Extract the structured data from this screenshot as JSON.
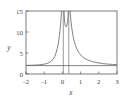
{
  "chart_data": {
    "type": "line",
    "title": "",
    "subtitle": "",
    "xlabel": "x",
    "ylabel": "y",
    "xlim": [
      -2,
      3
    ],
    "ylim": [
      0,
      15
    ],
    "grid": false,
    "legend": "none",
    "x_ticks": [
      "-2",
      "-1",
      "0",
      "1",
      "2",
      "3"
    ],
    "x_tick_values": [
      -2,
      -1,
      0,
      1,
      2,
      3
    ],
    "y_ticks": [
      "0",
      "5",
      "10",
      "15"
    ],
    "y_tick_values": [
      0,
      5,
      10,
      15
    ],
    "frame": "box",
    "line_color": "#6b6b6b",
    "asymptote_color": "#8f8f8f",
    "axis_color": "#5a5a5a",
    "background": "#ffffff",
    "vertical_asymptotes": [
      0.05,
      0.35
    ],
    "horizontal_asymptote": 2,
    "series": [
      {
        "name": "curve-left-branch",
        "description": "decreasing-from-asymptote branch approaching y=2 as x decreases",
        "points": [
          {
            "x": -2.0,
            "y": 2.05
          },
          {
            "x": -1.75,
            "y": 2.08
          },
          {
            "x": -1.5,
            "y": 2.12
          },
          {
            "x": -1.25,
            "y": 2.2
          },
          {
            "x": -1.0,
            "y": 2.35
          },
          {
            "x": -0.85,
            "y": 2.5
          },
          {
            "x": -0.7,
            "y": 2.8
          },
          {
            "x": -0.6,
            "y": 3.1
          },
          {
            "x": -0.5,
            "y": 3.6
          },
          {
            "x": -0.42,
            "y": 4.2
          },
          {
            "x": -0.35,
            "y": 5.0
          },
          {
            "x": -0.28,
            "y": 6.1
          },
          {
            "x": -0.22,
            "y": 7.4
          },
          {
            "x": -0.17,
            "y": 8.9
          },
          {
            "x": -0.13,
            "y": 10.4
          },
          {
            "x": -0.1,
            "y": 11.8
          },
          {
            "x": -0.075,
            "y": 13.2
          },
          {
            "x": -0.055,
            "y": 14.4
          },
          {
            "x": -0.04,
            "y": 15.0
          }
        ]
      },
      {
        "name": "curve-middle-branch",
        "description": "steep branch between the two vertical asymptotes",
        "points": [
          {
            "x": 0.09,
            "y": 15.0
          },
          {
            "x": 0.1,
            "y": 14.0
          },
          {
            "x": 0.115,
            "y": 13.0
          },
          {
            "x": 0.13,
            "y": 12.2
          },
          {
            "x": 0.15,
            "y": 11.6
          },
          {
            "x": 0.2,
            "y": 11.2
          },
          {
            "x": 0.25,
            "y": 11.6
          },
          {
            "x": 0.29,
            "y": 12.6
          },
          {
            "x": 0.31,
            "y": 13.8
          },
          {
            "x": 0.325,
            "y": 15.0
          }
        ]
      },
      {
        "name": "curve-right-branch",
        "description": "decreasing branch from right asymptote approaching y=2",
        "points": [
          {
            "x": 0.42,
            "y": 15.0
          },
          {
            "x": 0.45,
            "y": 13.6
          },
          {
            "x": 0.48,
            "y": 12.2
          },
          {
            "x": 0.52,
            "y": 10.8
          },
          {
            "x": 0.57,
            "y": 9.4
          },
          {
            "x": 0.63,
            "y": 8.1
          },
          {
            "x": 0.7,
            "y": 7.0
          },
          {
            "x": 0.8,
            "y": 5.9
          },
          {
            "x": 0.9,
            "y": 5.1
          },
          {
            "x": 1.05,
            "y": 4.3
          },
          {
            "x": 1.2,
            "y": 3.8
          },
          {
            "x": 1.4,
            "y": 3.3
          },
          {
            "x": 1.6,
            "y": 3.0
          },
          {
            "x": 1.9,
            "y": 2.7
          },
          {
            "x": 2.2,
            "y": 2.5
          },
          {
            "x": 2.5,
            "y": 2.35
          },
          {
            "x": 2.75,
            "y": 2.28
          },
          {
            "x": 3.0,
            "y": 2.22
          }
        ]
      },
      {
        "name": "horizontal-asymptote-line",
        "description": "flat horizontal reference line at y=2 spanning full x range",
        "points": [
          {
            "x": -2.0,
            "y": 2.0
          },
          {
            "x": 3.0,
            "y": 2.0
          }
        ]
      }
    ]
  }
}
